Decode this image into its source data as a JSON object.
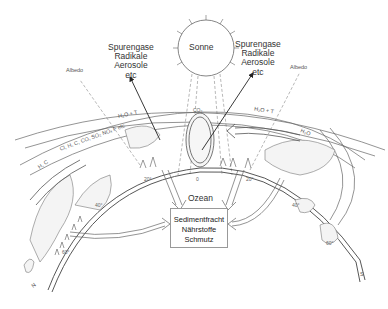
{
  "diagram": {
    "sun": {
      "label": "Sonne"
    },
    "left_sources": {
      "lines": [
        "Spurengase",
        "Radikale",
        "Aerosole",
        "etc"
      ]
    },
    "right_sources": {
      "lines": [
        "Spurengase",
        "Radikale",
        "Aerosole",
        "etc"
      ]
    },
    "albedo_left": "Albedo",
    "albedo_right": "Albedo",
    "band_outer_left": "H₂O + T",
    "band_outer_right": "H₂O + T",
    "band_inner_right": "H₂O",
    "band_gases": "Cl, H, C, CO, SO₂ NOₓ F  etc",
    "band_hc": "H, C",
    "cloud_label": "CO₂",
    "ocean_label": "Ozean",
    "sink_box": {
      "lines": [
        "Sedimentfracht",
        "Nährstoffe",
        "Schmutz"
      ]
    },
    "latitudes": [
      "0",
      "20°",
      "20°",
      "40°",
      "40°",
      "60°",
      "60°"
    ],
    "north": "N",
    "south": "S"
  }
}
